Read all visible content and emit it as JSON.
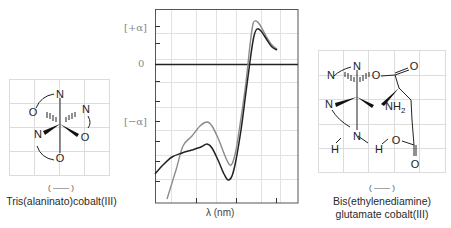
{
  "left_molecule": {
    "name": "Tris(alaninato)cobalt(III)",
    "legend_mark": "( —— )",
    "atoms": [
      "N",
      "O",
      "N",
      "N",
      "O",
      "O"
    ]
  },
  "right_molecule": {
    "name_line1": "Bis(ethylenediamine)",
    "name_line2": "glutamate cobalt(III)",
    "legend_mark": "( —— )",
    "atoms": [
      "N",
      "N",
      "O",
      "O",
      "NH2",
      "N",
      "N",
      "H",
      "H",
      "O",
      "O"
    ]
  },
  "chart": {
    "y_labels": {
      "plus": "[+α]",
      "zero": "0",
      "minus": "[−α]"
    },
    "x_label": "λ (nm)"
  },
  "chart_data": {
    "type": "line",
    "title": "",
    "xlabel": "λ (nm)",
    "ylabel": "",
    "y_tick_labels": [
      "[+α]",
      "0",
      "[−α]"
    ],
    "grid": true,
    "series": [
      {
        "name": "Tris(alaninato)cobalt(III)",
        "color": "#8a8a8a",
        "points_px": [
          [
            167,
            199
          ],
          [
            176,
            170
          ],
          [
            183,
            146
          ],
          [
            192,
            136
          ],
          [
            200,
            126
          ],
          [
            207,
            122
          ],
          [
            212,
            126
          ],
          [
            218,
            138
          ],
          [
            225,
            156
          ],
          [
            229,
            164
          ],
          [
            232,
            164
          ],
          [
            236,
            150
          ],
          [
            241,
            118
          ],
          [
            246,
            82
          ],
          [
            250,
            45
          ],
          [
            253,
            24
          ],
          [
            256,
            21
          ],
          [
            260,
            25
          ],
          [
            266,
            36
          ],
          [
            272,
            45
          ],
          [
            277,
            49
          ]
        ]
      },
      {
        "name": "Bis(ethylenediamine) glutamate cobalt(III)",
        "color": "#222222",
        "points_px": [
          [
            155,
            174
          ],
          [
            163,
            165
          ],
          [
            172,
            157
          ],
          [
            182,
            153
          ],
          [
            192,
            150
          ],
          [
            201,
            147
          ],
          [
            207,
            144
          ],
          [
            212,
            148
          ],
          [
            218,
            160
          ],
          [
            224,
            174
          ],
          [
            228,
            180
          ],
          [
            232,
            176
          ],
          [
            236,
            160
          ],
          [
            241,
            130
          ],
          [
            246,
            92
          ],
          [
            251,
            54
          ],
          [
            254,
            36
          ],
          [
            257,
            29
          ],
          [
            261,
            31
          ],
          [
            267,
            40
          ],
          [
            272,
            47
          ],
          [
            277,
            50
          ]
        ]
      }
    ]
  }
}
